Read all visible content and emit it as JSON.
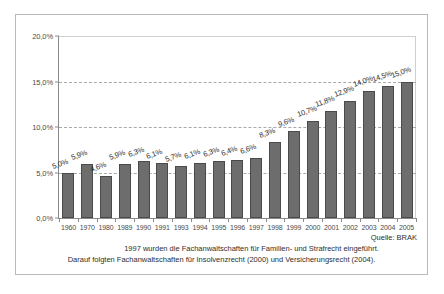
{
  "chart_data": {
    "type": "bar",
    "title": "",
    "subtitle": "",
    "xlabel": "",
    "ylabel": "",
    "ylim": [
      0,
      20
    ],
    "ytick_labels": [
      "20,0%",
      "15,0%",
      "10,0%",
      "5,0%",
      "0,0%"
    ],
    "ytick_values": [
      20,
      15,
      10,
      5,
      0
    ],
    "grid": true,
    "legend": null,
    "categories": [
      "1960",
      "1970",
      "1980",
      "1989",
      "1990",
      "1991",
      "1993",
      "1994",
      "1995",
      "1996",
      "1997",
      "1998",
      "1999",
      "2000",
      "2001",
      "2002",
      "2003",
      "2004",
      "2005"
    ],
    "values": [
      5.0,
      5.9,
      4.6,
      5.9,
      6.3,
      6.1,
      5.7,
      6.1,
      6.3,
      6.4,
      6.6,
      8.3,
      9.6,
      10.7,
      11.8,
      12.9,
      14.0,
      14.5,
      15.0
    ],
    "data_labels": [
      "5,0%",
      "5,9%",
      "4,6%",
      "5,9%",
      "6,3%",
      "6,1%",
      "5,7%",
      "6,1%",
      "6,3%",
      "6,4%",
      "6,6%",
      "8,3%",
      "9,6%",
      "10,7%",
      "11,8%",
      "12,9%",
      "14,0%",
      "14,5%",
      "15,0%"
    ],
    "bar_color": "#6d6d6d",
    "bar_border_color": "#4a4a4a",
    "grid_color": "#a9a9a9",
    "axis_color": "#8a8a8a",
    "annotations": [
      "Quelle: BRAK",
      "1997 wurden die Fachanwaltschaften für Familien- und Strafrecht eingeführt.",
      "Darauf folgten Fachanwaltschaften für Insolvenzrecht (2000) und Versicherungsrecht (2004)."
    ]
  },
  "footer": {
    "source": "Quelle: BRAK",
    "note_1": "1997 wurden die Fachanwaltschaften für Familien- und Strafrecht eingeführt.",
    "note_2": "Darauf folgten Fachanwaltschaften für Insolvenzrecht (2000) und Versicherungsrecht (2004)."
  }
}
